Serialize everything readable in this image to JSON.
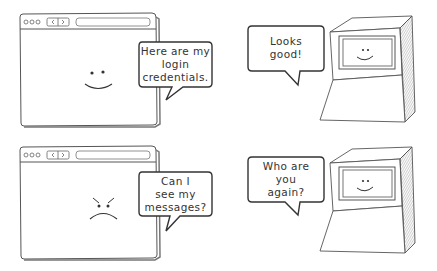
{
  "panels": [
    {
      "browser": {
        "mood": "happy",
        "face_icon": "smiley-face-icon",
        "speech": [
          "Here are my",
          "login",
          "credentials."
        ]
      },
      "server": {
        "mood": "happy",
        "face_icon": "smiley-face-icon",
        "speech": [
          "Looks",
          "good!"
        ]
      }
    },
    {
      "browser": {
        "mood": "angry",
        "face_icon": "angry-face-icon",
        "speech": [
          "Can I",
          "see my",
          "messages?"
        ]
      },
      "server": {
        "mood": "happy",
        "face_icon": "smiley-face-icon",
        "speech": [
          "Who are",
          "you",
          "again?"
        ]
      }
    }
  ],
  "colors": {
    "stroke": "#444444",
    "bubble_border": "#333333",
    "text": "#333333",
    "background": "#ffffff"
  }
}
